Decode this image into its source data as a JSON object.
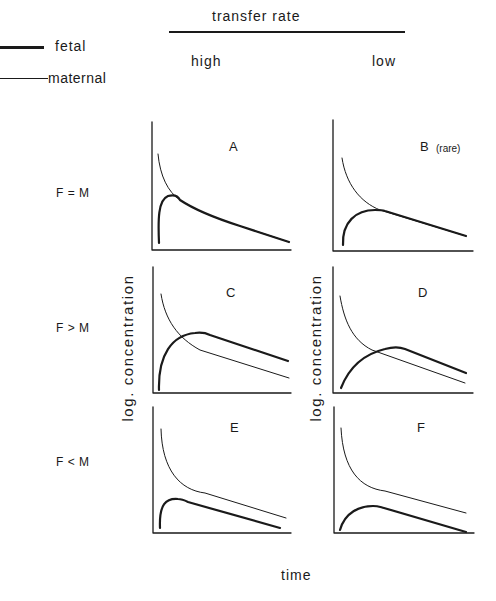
{
  "header": {
    "title": "transfer rate",
    "columns": [
      "high",
      "low"
    ]
  },
  "legend": {
    "items": [
      {
        "label": "fetal",
        "style": "thick line"
      },
      {
        "label": "maternal",
        "style": "thin line"
      }
    ]
  },
  "rows": [
    {
      "label": "F = M"
    },
    {
      "label": "F > M"
    },
    {
      "label": "F < M"
    }
  ],
  "panels": [
    {
      "id": "A",
      "label": "A",
      "note": ""
    },
    {
      "id": "B",
      "label": "B",
      "note": "(rare)"
    },
    {
      "id": "C",
      "label": "C",
      "note": ""
    },
    {
      "id": "D",
      "label": "D",
      "note": ""
    },
    {
      "id": "E",
      "label": "E",
      "note": ""
    },
    {
      "id": "F",
      "label": "F",
      "note": ""
    }
  ],
  "axes": {
    "ylabel": "log. concentration",
    "xlabel": "time"
  },
  "colors": {
    "ink": "#1a1a1a",
    "background": "#ffffff"
  }
}
